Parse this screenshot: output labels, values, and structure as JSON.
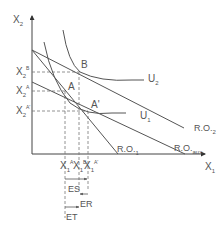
{
  "diagram": {
    "type": "economics-indifference-curve",
    "axes": {
      "y_label": "X",
      "y_label_sub": "2",
      "x_label": "X",
      "x_label_sub": "1"
    },
    "y_ticks": [
      {
        "base": "X",
        "sub": "2",
        "sup": "B"
      },
      {
        "base": "X",
        "sub": "2",
        "sup": "A"
      },
      {
        "base": "X",
        "sub": "2",
        "sup": "A'"
      }
    ],
    "x_ticks": [
      {
        "base": "X",
        "sub": "1",
        "sup": "A"
      },
      {
        "base": "X",
        "sub": "1",
        "sup": "B"
      },
      {
        "base": "X",
        "sub": "1",
        "sup": "A'"
      }
    ],
    "points": {
      "B": "B",
      "A": "A",
      "A_prime": "A'"
    },
    "curves": {
      "U2": {
        "base": "U",
        "sub": "2"
      },
      "U1": {
        "base": "U",
        "sub": "1"
      }
    },
    "budget_lines": {
      "RO2": {
        "base": "R.O.",
        "sub": "2"
      },
      "RO1": {
        "base": "R.O.",
        "sub": "1"
      },
      "ROaux": {
        "base": "R.O.",
        "sub": "aux"
      }
    },
    "effects": {
      "ES": "ES",
      "ER": "ER",
      "ET": "ET"
    },
    "colors": {
      "line": "#555555",
      "dashed": "#777777",
      "text": "#555555"
    }
  }
}
